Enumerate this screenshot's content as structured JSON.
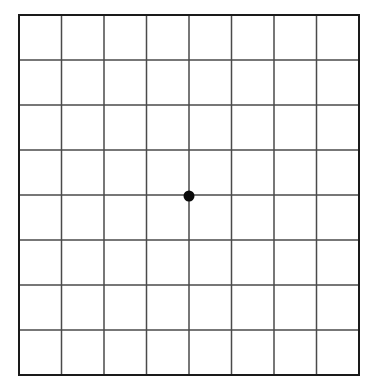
{
  "chart_data": {
    "type": "table",
    "title": "Amsler Grid",
    "subtitle": "",
    "xlabel": "",
    "ylabel": "",
    "grid": true,
    "legend": null,
    "legend_position": "none",
    "categories": [],
    "values": [],
    "columns": 8,
    "rows": 8,
    "cell_width_px": 42.5,
    "cell_height_px": 45.0,
    "x": [
      19,
      61.5,
      104,
      146.5,
      189,
      231.5,
      274,
      316.5,
      359
    ],
    "y": [
      15,
      60,
      105,
      150,
      195,
      240,
      285,
      330,
      375
    ],
    "xlim": [
      19,
      359
    ],
    "ylim": [
      15,
      375
    ],
    "fixation_point": {
      "label": "center-fixation-dot",
      "x": 189,
      "y": 196,
      "radius_px": 5.5,
      "color": "#0a0a0a"
    },
    "colors": {
      "background": "#ffffff",
      "cell_fill": "#ffffff",
      "outer_border": "#1a1a1a",
      "grid_line": "#4a4a4a",
      "dot": "#0a0a0a"
    },
    "line_widths": {
      "outer_border_px": 2.6,
      "grid_line_px": 1.5
    }
  },
  "page": {
    "title": "Amsler Grid",
    "alt_text": "Amsler grid: an eight by eight square grid with a solid black fixation dot at the center"
  }
}
